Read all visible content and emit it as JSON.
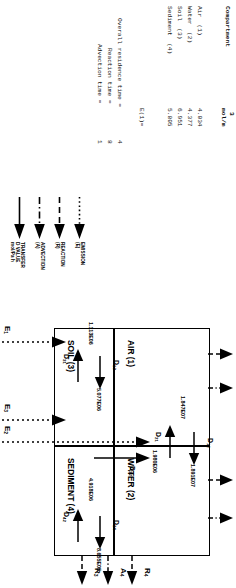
{
  "figure": {
    "type": "level-iii-fugacity-multimedia-model-diagram",
    "orientation_note": "page rotated 90 degrees"
  },
  "report": {
    "columns": {
      "compartment": "Compartment",
      "concentration": "mol/m",
      "concentration_exp": "3"
    },
    "rows": [
      {
        "name": "Air  (1)",
        "value": "4.034"
      },
      {
        "name": "Water  (2)",
        "value": "4.377"
      },
      {
        "name": "Soil  (3)",
        "value": "6.951"
      },
      {
        "name": "Sediment  (4)",
        "value": "5.805"
      }
    ],
    "emission_label": "E(1)=",
    "times": [
      {
        "label": "Overall residence time =",
        "value": "4"
      },
      {
        "label": "Reaction time =",
        "value": "8"
      },
      {
        "label": "Advection time =",
        "value": "1"
      }
    ]
  },
  "legend": {
    "items": [
      {
        "name": "EMISSION (E)",
        "line": "dotted"
      },
      {
        "name": "REACTION (R)",
        "line": "dashed"
      },
      {
        "name": "ADVECTION (A)",
        "line": "dashdot"
      },
      {
        "name": "TRANSFER D VALUE mol/Pa h",
        "line": "solid"
      }
    ]
  },
  "diagram": {
    "compartments": [
      {
        "id": 1,
        "label": "AIR (1)"
      },
      {
        "id": 2,
        "label": "WATER (2)"
      },
      {
        "id": 3,
        "label": "SOIL (3)"
      },
      {
        "id": 4,
        "label": "SEDIMENT (4)"
      }
    ],
    "transfers": [
      {
        "label": "D",
        "sub": "12",
        "value": "1.891E07"
      },
      {
        "label": "D",
        "sub": "21",
        "value": "1.847E07"
      },
      {
        "label": "D",
        "sub": "13",
        "value": "5.077E06"
      },
      {
        "label": "D",
        "sub": "31",
        "value": "1.113E06"
      },
      {
        "label": "D",
        "sub": "24",
        "value": "8.655E05"
      },
      {
        "label": "D",
        "sub": "42",
        "value": "4.918E06"
      },
      {
        "label": "D",
        "sub": "32",
        "value": "1.980E06"
      }
    ],
    "emissions": [
      {
        "label": "E",
        "sub": "1"
      },
      {
        "label": "E",
        "sub": "2"
      },
      {
        "label": "E",
        "sub": "3"
      }
    ],
    "reactions": [
      {
        "label": "R",
        "sub": "1"
      },
      {
        "label": "R",
        "sub": "2"
      },
      {
        "label": "R",
        "sub": "3"
      },
      {
        "label": "R",
        "sub": "4"
      }
    ],
    "advections": [
      {
        "label": "A",
        "sub": "1"
      },
      {
        "label": "A",
        "sub": "2"
      },
      {
        "label": "A",
        "sub": "4"
      }
    ]
  }
}
